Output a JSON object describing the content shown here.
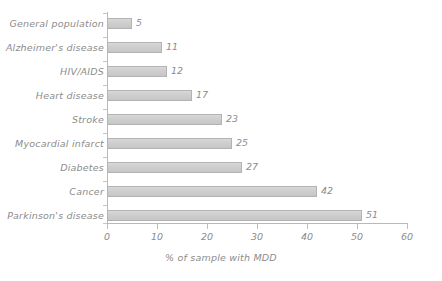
{
  "chart_data": {
    "type": "bar",
    "orientation": "horizontal",
    "title": "",
    "xlabel": "% of sample with MDD",
    "ylabel": "",
    "xlim": [
      0,
      60
    ],
    "xticks": [
      0,
      10,
      20,
      30,
      40,
      50,
      60
    ],
    "grid": false,
    "legend": null,
    "categories": [
      "General population",
      "Alzheimer's disease",
      "HIV/AIDS",
      "Heart disease",
      "Stroke",
      "Myocardial infarct",
      "Diabetes",
      "Cancer",
      "Parkinson's disease"
    ],
    "values": [
      5,
      11,
      12,
      17,
      23,
      25,
      27,
      42,
      51
    ],
    "value_labels": [
      "5",
      "11",
      "12",
      "17",
      "23",
      "25",
      "27",
      "42",
      "51"
    ],
    "bar_color": "#cfcfcf",
    "bar_border_color": "#b3b3b3",
    "text_color": "#8c8c8c",
    "axis_color": "#b9b9b9",
    "background": "#ffffff"
  }
}
